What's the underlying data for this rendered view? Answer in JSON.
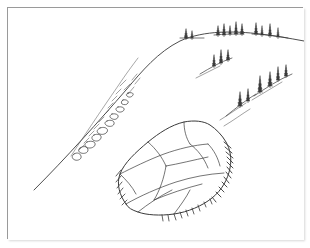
{
  "artwork": {
    "title": "Hillside landscape with large boulder",
    "medium": "pen-and-ink line drawing",
    "caption": "",
    "background_color": "#ffffff",
    "ink_color": "#3a3a3a",
    "frame_color": "#9a9a9a"
  },
  "scene": {
    "ridgeline_label": "hill ridge skyline",
    "slope_label": "left descending slope",
    "boulder_label": "large faceted boulder",
    "scree_label": "scree rubble trail",
    "tree_clusters_label": "conifer tree clusters",
    "shadow_label": "ground shadow strokes"
  },
  "geometry": {
    "viewbox": "0 0 296 232",
    "ridge_path": "M 26 182 C 58 150 92 112 118 82 C 134 63 150 44 172 33 C 196 22 228 23 252 26 C 268 28 280 30 296 33",
    "scree_path": "M 63 148 C 76 128 92 104 110 78 C 118 66 124 58 130 50",
    "scree_marks": [
      "M 66 146 c 3 -2 6 -1 7 2 c 1 3 -3 5 -6 4 c -3 -1 -4 -4 -1 -6 z",
      "M 72 140 c 4 -3 8 -1 8 2 c 0 3 -4 4 -7 3 c -3 -1 -3 -4 -1 -5 z",
      "M 79 134 c 5 -2 9 0 8 3 c -1 3 -6 4 -9 2 c -2 -2 -1 -4 1 -5 z",
      "M 86 127 c 4 -2 8 0 7 3 c -1 3 -5 4 -8 2 c -2 -2 -1 -4 1 -5 z",
      "M 92 120 c 5 -2 9 1 7 4 c -2 3 -7 3 -9 1 c -2 -2 0 -4 2 -5 z",
      "M 99 113 c 4 -2 8 0 7 3 c -1 3 -6 3 -8 1 c -2 -2 -1 -3 1 -4 z",
      "M 104 106 c 4 -1 7 1 6 3 c -1 3 -5 3 -7 1 c -2 -1 -1 -3 1 -4 z",
      "M 110 99 c 4 -1 7 1 6 3 c -1 2 -5 3 -7 1 c -2 -2 -1 -3 1 -4 z",
      "M 115 92 c 3 -1 6 1 5 3 c -1 2 -4 2 -6 1 c -1 -1 -1 -3 1 -4 z",
      "M 120 85 c 3 -1 6 0 5 2 c -1 2 -4 3 -6 1 c -1 -1 -1 -2 1 -3 z"
    ],
    "scree_hatches": [
      "M 112 78 l 6 -6",
      "M 116 82 l 6 -6",
      "M 120 86 l 6 -7",
      "M 108 86 l 5 -5",
      "M 104 93 l 5 -5",
      "M 100 100 l 5 -5",
      "M 96 107 l 5 -5",
      "M 91 114 l 5 -5",
      "M 86 121 l 5 -5",
      "M 81 128 l 5 -5",
      "M 76 135 l 5 -5",
      "M 71 142 l 5 -5",
      "M 124 72 l 5 -6",
      "M 127 76 l 5 -6"
    ],
    "boulder_outline": "M 118 196 C 112 188 108 176 112 166 C 116 155 128 144 140 134 C 151 125 163 117 176 114 C 186 112 196 113 202 117 C 208 121 214 127 218 134 C 222 141 224 150 222 160 C 220 171 214 182 204 190 C 194 198 180 204 166 206 C 152 208 138 207 130 204 C 124 202 120 200 118 196 Z",
    "boulder_facets": [
      "M 112 166 C 124 160 140 152 156 146 C 170 141 186 137 200 136",
      "M 140 134 C 148 141 154 149 158 158",
      "M 176 114 C 176 122 178 130 182 136",
      "M 158 158 C 170 156 186 152 200 149",
      "M 158 158 C 156 170 152 182 146 192",
      "M 118 196 C 132 188 150 180 168 174 C 184 169 200 166 216 165",
      "M 146 192 C 160 186 178 180 194 176",
      "M 130 204 C 140 196 152 188 164 182",
      "M 182 136 C 190 142 196 150 200 160",
      "M 200 136 C 206 142 210 150 212 158",
      "M 112 166 C 118 172 124 178 128 186",
      "M 166 206 C 172 198 178 190 182 182"
    ],
    "boulder_hatch_right": [
      "M 216 134 l 7 6",
      "M 217 139 l 7 6",
      "M 218 144 l 7 6",
      "M 219 149 l 6 6",
      "M 219 154 l 6 6",
      "M 219 159 l 5 6",
      "M 218 164 l 5 6",
      "M 216 169 l 5 6",
      "M 214 174 l 5 5",
      "M 211 179 l 5 5",
      "M 208 184 l 5 5",
      "M 204 189 l 4 5"
    ],
    "boulder_hatch_left": [
      "M 113 162 l -5 6",
      "M 113 168 l -5 6",
      "M 114 174 l -5 6",
      "M 115 180 l -5 6",
      "M 117 186 l -5 5",
      "M 119 192 l -5 5"
    ],
    "boulder_hatch_bottom": [
      "M 166 206 l 2 6",
      "M 172 204 l 2 6",
      "M 178 202 l 2 6",
      "M 184 200 l 2 6",
      "M 190 197 l 2 6",
      "M 196 194 l 2 5",
      "M 202 191 l 2 5",
      "M 160 207 l 1 6",
      "M 154 207 l 1 6"
    ],
    "tree_groups": [
      {
        "name": "ridge-cluster-left",
        "ground": "M 172 30 C 180 30 188 30 196 30",
        "trees": [
          {
            "x": 178,
            "y": 30,
            "h": 9,
            "w": 4
          },
          {
            "x": 184,
            "y": 30,
            "h": 7,
            "w": 3
          }
        ]
      },
      {
        "name": "ridge-cluster-mid",
        "ground": "M 206 27 C 216 26 226 26 236 26",
        "trees": [
          {
            "x": 210,
            "y": 27,
            "h": 9,
            "w": 4
          },
          {
            "x": 216,
            "y": 27,
            "h": 11,
            "w": 4
          },
          {
            "x": 222,
            "y": 26,
            "h": 8,
            "w": 3
          },
          {
            "x": 228,
            "y": 26,
            "h": 12,
            "w": 4
          },
          {
            "x": 234,
            "y": 26,
            "h": 10,
            "w": 4
          }
        ]
      },
      {
        "name": "ridge-cluster-right",
        "ground": "M 244 26 C 256 26 268 28 280 30",
        "trees": [
          {
            "x": 248,
            "y": 26,
            "h": 11,
            "w": 4
          },
          {
            "x": 254,
            "y": 27,
            "h": 9,
            "w": 3
          },
          {
            "x": 262,
            "y": 28,
            "h": 12,
            "w": 4
          },
          {
            "x": 270,
            "y": 29,
            "h": 9,
            "w": 3
          }
        ]
      },
      {
        "name": "slope-cluster-upper",
        "ground": "M 192 66 C 202 60 212 54 224 50",
        "trees": [
          {
            "x": 206,
            "y": 58,
            "h": 11,
            "w": 4
          },
          {
            "x": 213,
            "y": 55,
            "h": 13,
            "w": 4
          },
          {
            "x": 220,
            "y": 52,
            "h": 10,
            "w": 4
          }
        ]
      },
      {
        "name": "slope-cluster-lower-left",
        "ground": "M 218 108 C 228 100 238 92 248 86",
        "trees": [
          {
            "x": 232,
            "y": 98,
            "h": 14,
            "w": 5
          },
          {
            "x": 240,
            "y": 93,
            "h": 12,
            "w": 4
          }
        ]
      },
      {
        "name": "slope-cluster-lower-right",
        "ground": "M 246 88 C 258 80 270 72 284 66",
        "trees": [
          {
            "x": 252,
            "y": 84,
            "h": 16,
            "w": 5
          },
          {
            "x": 262,
            "y": 78,
            "h": 14,
            "w": 5
          },
          {
            "x": 270,
            "y": 72,
            "h": 13,
            "w": 4
          },
          {
            "x": 278,
            "y": 68,
            "h": 11,
            "w": 4
          }
        ]
      }
    ],
    "ground_shadows": [
      "M 188 70 C 196 66 204 62 212 58",
      "M 212 112 C 222 106 230 100 238 95",
      "M 216 118 C 226 112 234 106 242 101",
      "M 244 92 C 254 86 264 80 274 74"
    ]
  }
}
